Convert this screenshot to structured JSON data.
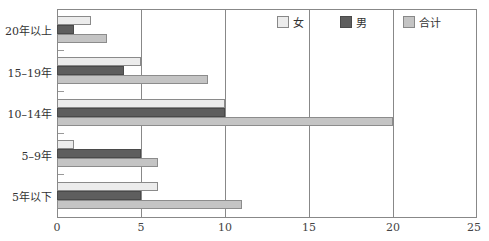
{
  "chart_data": {
    "type": "bar",
    "orientation": "horizontal",
    "title": "",
    "xlabel": "",
    "ylabel": "",
    "categories": [
      "20年以上",
      "15–19年",
      "10–14年",
      "5–9年",
      "5年以下"
    ],
    "series": [
      {
        "name": "女",
        "color": "#ececec",
        "values": [
          2,
          5,
          10,
          1,
          6
        ]
      },
      {
        "name": "男",
        "color": "#5e5e5e",
        "values": [
          1,
          4,
          10,
          5,
          5
        ]
      },
      {
        "name": "合计",
        "color": "#c4c4c4",
        "values": [
          3,
          9,
          20,
          6,
          11
        ]
      }
    ],
    "xlim": [
      0,
      25
    ],
    "xticks": [
      0,
      5,
      10,
      15,
      20,
      25
    ],
    "grid": true,
    "legend_position": "top-right (inside plot)"
  },
  "legend": {
    "female": "女",
    "male": "男",
    "total": "合计"
  },
  "axis": {
    "ticks": [
      "0",
      "5",
      "10",
      "15",
      "20",
      "25"
    ]
  },
  "categories": {
    "c0": "20年以上",
    "c1": "15–19年",
    "c2": "10–14年",
    "c3": "5–9年",
    "c4": "5年以下"
  }
}
